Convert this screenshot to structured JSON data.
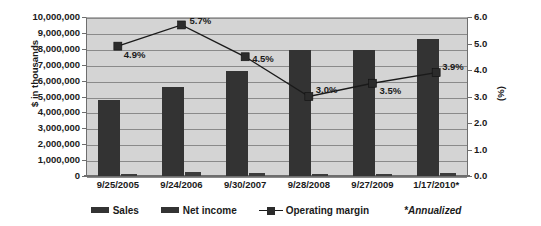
{
  "chart_data": {
    "type": "bar",
    "title": "",
    "subtitle": "",
    "ylabel": "$ in thousands",
    "ylabel_right": "(%)",
    "xlabel": "",
    "grid": true,
    "legend_position": "bottom",
    "categories": [
      "9/25/2005",
      "9/24/2006",
      "9/30/2007",
      "9/28/2008",
      "9/27/2009",
      "1/17/2010*"
    ],
    "ylim": [
      0,
      10000000
    ],
    "ylim_right": [
      0.0,
      6.0
    ],
    "yticks": [
      "0",
      "1,000,000",
      "2,000,000",
      "3,000,000",
      "4,000,000",
      "5,000,000",
      "6,000,000",
      "7,000,000",
      "8,000,000",
      "9,000,000",
      "10,000,000"
    ],
    "yticks_right": [
      "0.0",
      "1.0",
      "2.0",
      "3.0",
      "4.0",
      "5.0",
      "6.0"
    ],
    "series": [
      {
        "name": "Sales",
        "type": "bar",
        "axis": "left",
        "color": "#333333",
        "values": [
          4750000,
          5600000,
          6600000,
          7900000,
          7920000,
          8620000
        ]
      },
      {
        "name": "Net income",
        "type": "bar",
        "axis": "left",
        "color": "#3c3c3c",
        "values": [
          150000,
          260000,
          175000,
          150000,
          130000,
          175000
        ]
      },
      {
        "name": "Operating margin",
        "type": "line",
        "axis": "right",
        "color": "#1a1a1a",
        "values": [
          4.9,
          5.7,
          4.5,
          3.0,
          3.5,
          3.9
        ],
        "point_labels": [
          "4.9%",
          "5.7%",
          "4.5%",
          "3.0%",
          "3.5%",
          "3.9%"
        ]
      }
    ],
    "annotations": [
      {
        "text": "*Annualized",
        "style": "italic",
        "position": "legend-right"
      }
    ],
    "colors": {
      "plot_background": "#d4d4d4",
      "gridline": "#8a8a8a",
      "axis": "#6e6e6e",
      "text": "#1a1a1a",
      "page_background": "#ffffff"
    }
  },
  "legend": {
    "items": [
      {
        "label": "Sales",
        "marker": "bar-swatch-icon"
      },
      {
        "label": "Net income",
        "marker": "bar-swatch-icon"
      },
      {
        "label": "Operating margin",
        "marker": "line-marker-swatch-icon"
      }
    ],
    "note": "*Annualized"
  }
}
